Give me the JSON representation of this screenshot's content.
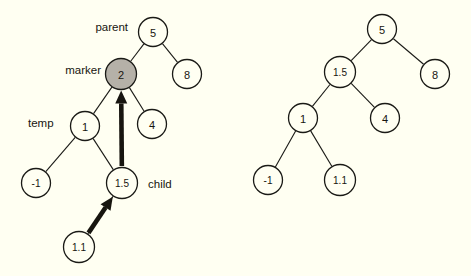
{
  "figure": {
    "background_color": "#fffff2",
    "stroke_color": "#17150f",
    "marker_fill_color": "#b5b1a8",
    "title": ""
  },
  "left_tree": {
    "caption": "",
    "nodes": [
      {
        "id": "l-5",
        "value": "5",
        "cx": 153,
        "cy": 32,
        "r": 14.5,
        "filled": false
      },
      {
        "id": "l-2",
        "value": "2",
        "cx": 121,
        "cy": 74,
        "r": 15.5,
        "filled": true
      },
      {
        "id": "l-8",
        "value": "8",
        "cx": 187,
        "cy": 74,
        "r": 14.5,
        "filled": false
      },
      {
        "id": "l-1",
        "value": "1",
        "cx": 85,
        "cy": 126,
        "r": 14.5,
        "filled": false
      },
      {
        "id": "l-4",
        "value": "4",
        "cx": 152,
        "cy": 124,
        "r": 14.5,
        "filled": false
      },
      {
        "id": "l-m1",
        "value": "-1",
        "cx": 36,
        "cy": 183,
        "r": 14.5,
        "filled": false
      },
      {
        "id": "l-1.5",
        "value": "1.5",
        "cx": 122,
        "cy": 183,
        "r": 15.5,
        "filled": false
      },
      {
        "id": "l-1.1",
        "value": "1.1",
        "cx": 79,
        "cy": 247,
        "r": 15.5,
        "filled": false
      }
    ],
    "edges": [
      {
        "from": "l-5",
        "to": "l-2"
      },
      {
        "from": "l-5",
        "to": "l-8"
      },
      {
        "from": "l-2",
        "to": "l-1"
      },
      {
        "from": "l-2",
        "to": "l-4"
      },
      {
        "from": "l-1",
        "to": "l-m1"
      },
      {
        "from": "l-1",
        "to": "l-1.5"
      },
      {
        "from": "l-1.5",
        "to": "l-1.1"
      }
    ],
    "arrows": [
      {
        "id": "arrow-1.5-to-2",
        "from": "l-1.5",
        "to": "l-2",
        "style": "thick"
      },
      {
        "id": "arrow-1.1-to-1.5",
        "from": "l-1.1",
        "to": "l-1.5",
        "style": "thick"
      }
    ],
    "annotations": [
      {
        "id": "parent",
        "text": "parent",
        "x": 128,
        "y": 27,
        "align": "end"
      },
      {
        "id": "marker",
        "text": "marker",
        "x": 101,
        "y": 70,
        "align": "end"
      },
      {
        "id": "temp",
        "text": "temp",
        "x": 28,
        "y": 123,
        "align": "start"
      },
      {
        "id": "child",
        "text": "child",
        "x": 148,
        "y": 184,
        "align": "start"
      }
    ]
  },
  "right_tree": {
    "caption": "",
    "nodes": [
      {
        "id": "r-5",
        "value": "5",
        "cx": 382,
        "cy": 29,
        "r": 14.5,
        "filled": false
      },
      {
        "id": "r-1.5",
        "value": "1.5",
        "cx": 340,
        "cy": 72,
        "r": 15.5,
        "filled": false
      },
      {
        "id": "r-8",
        "value": "8",
        "cx": 435,
        "cy": 74,
        "r": 14.5,
        "filled": false
      },
      {
        "id": "r-1",
        "value": "1",
        "cx": 303,
        "cy": 118,
        "r": 14.5,
        "filled": false
      },
      {
        "id": "r-4",
        "value": "4",
        "cx": 385,
        "cy": 118,
        "r": 14.5,
        "filled": false
      },
      {
        "id": "r-m1",
        "value": "-1",
        "cx": 268,
        "cy": 180,
        "r": 14.5,
        "filled": false
      },
      {
        "id": "r-1.1",
        "value": "1.1",
        "cx": 340,
        "cy": 180,
        "r": 15.5,
        "filled": false
      }
    ],
    "edges": [
      {
        "from": "r-5",
        "to": "r-1.5"
      },
      {
        "from": "r-5",
        "to": "r-8"
      },
      {
        "from": "r-1.5",
        "to": "r-1"
      },
      {
        "from": "r-1.5",
        "to": "r-4"
      },
      {
        "from": "r-1",
        "to": "r-m1"
      },
      {
        "from": "r-1",
        "to": "r-1.1"
      }
    ],
    "arrows": [],
    "annotations": []
  }
}
